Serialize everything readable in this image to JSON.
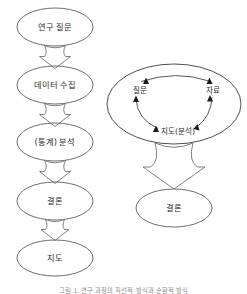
{
  "diagram": {
    "title_caption": "그림 1. 연구 과정의 직선적 방식과 순환적 방식",
    "linear_flow": {
      "name": "linear-research-process",
      "nodes": [
        {
          "id": "research-question",
          "label": "연구 질문",
          "cx": 55,
          "cy": 27,
          "rx": 38,
          "ry": 19
        },
        {
          "id": "data-collection",
          "label": "데이터 수집",
          "cx": 55,
          "cy": 85,
          "rx": 38,
          "ry": 19
        },
        {
          "id": "statistical-analysis",
          "label": "(통계) 분석",
          "cx": 55,
          "cy": 142,
          "rx": 38,
          "ry": 19
        },
        {
          "id": "conclusion",
          "label": "결론",
          "cx": 55,
          "cy": 201,
          "rx": 38,
          "ry": 19
        },
        {
          "id": "map",
          "label": "지도",
          "cx": 55,
          "cy": 258,
          "rx": 38,
          "ry": 18
        }
      ],
      "arrows": [
        {
          "id": "arrow-question-to-data",
          "from": "research-question",
          "to": "data-collection"
        },
        {
          "id": "arrow-data-to-analysis",
          "from": "data-collection",
          "to": "statistical-analysis"
        },
        {
          "id": "arrow-analysis-to-conclusion",
          "from": "statistical-analysis",
          "to": "conclusion"
        },
        {
          "id": "arrow-conclusion-to-map",
          "from": "conclusion",
          "to": "map"
        }
      ]
    },
    "cyclical_flow": {
      "name": "cyclical-research-process",
      "container": {
        "id": "cycle-ellipse",
        "cx": 174,
        "cy": 104,
        "rx": 67,
        "ry": 40
      },
      "cycle_nodes": [
        {
          "id": "cycle-question",
          "label": "질문",
          "x": 140,
          "y": 90
        },
        {
          "id": "cycle-data",
          "label": "자료",
          "x": 213,
          "y": 90
        },
        {
          "id": "cycle-map-analysis",
          "label": "지도(분석)",
          "x": 178,
          "y": 131
        }
      ],
      "cycle_direction": "clockwise",
      "output_node": {
        "id": "cycle-conclusion",
        "label": "결론",
        "cx": 174,
        "cy": 208,
        "rx": 38,
        "ry": 19
      },
      "arrows": [
        {
          "id": "arrow-cycle-to-conclusion",
          "from": "cycle-ellipse",
          "to": "cycle-conclusion"
        }
      ]
    },
    "colors": {
      "background": "#ffffff",
      "ellipse_stroke": "#5d5d5d",
      "cycle_stroke": "#3a3a3a",
      "arrow_stroke": "#6a6a6a",
      "arrow_fill": "#ffffff",
      "arrowhead_fill": "#1a1a1a",
      "text": "#2b2b2b",
      "caption_text": "#8d8d8d"
    }
  }
}
